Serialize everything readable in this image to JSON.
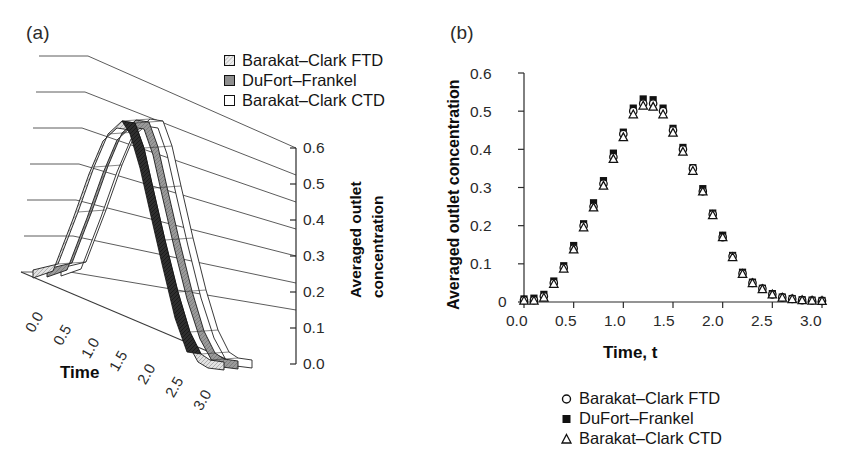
{
  "figure": {
    "background": "#ffffff",
    "width": 849,
    "height": 465
  },
  "panel_a": {
    "label": "(a)",
    "xaxis_title": "Time",
    "zaxis_title_line1": "Averaged outlet",
    "zaxis_title_line2": "concentration",
    "x_ticks": [
      "0.0",
      "0.5",
      "1.0",
      "1.5",
      "2.0",
      "2.5",
      "3.0"
    ],
    "z_ticks": [
      "0.6",
      "0.5",
      "0.4",
      "0.3",
      "0.2",
      "0.1",
      "0.0"
    ],
    "legend": [
      {
        "label": "Barakat–Clark FTD",
        "swatch": "light-hatched-square",
        "color": "#d8d8d8"
      },
      {
        "label": "DuFort–Frankel",
        "swatch": "gray-square",
        "color": "#8e8e8e"
      },
      {
        "label": "Barakat–Clark CTD",
        "swatch": "white-square",
        "color": "#ffffff"
      }
    ]
  },
  "panel_b": {
    "label": "(b)",
    "xaxis_title": "Time, t",
    "yaxis_title": "Averaged outlet concentration",
    "x_ticks": [
      "0.0",
      "0.5",
      "1.0",
      "1.5",
      "2.0",
      "2.5",
      "3.0"
    ],
    "y_ticks": [
      "0.6",
      "0.5",
      "0.4",
      "0.3",
      "0.2",
      "0.1",
      "0"
    ],
    "legend": [
      {
        "label": "Barakat–Clark FTD",
        "marker": "open-circle"
      },
      {
        "label": "DuFort–Frankel",
        "marker": "filled-square"
      },
      {
        "label": "Barakat–Clark CTD",
        "marker": "open-triangle"
      }
    ]
  },
  "chart_data": [
    {
      "type": "line",
      "id": "panel-a-surface-3d",
      "title": "(a)",
      "xlabel": "Time",
      "zlabel": "Averaged outlet concentration",
      "xlim": [
        0.0,
        3.0
      ],
      "zlim": [
        0.0,
        0.6
      ],
      "grid": true,
      "legend_position": "top-right",
      "note": "3D ribbon surface: three parallel method curves drawn as shaded bands over a sloping grid floor",
      "series": [
        {
          "name": "Barakat–Clark FTD",
          "fill": "#d8d8d8",
          "x": [
            0.0,
            0.1,
            0.2,
            0.3,
            0.4,
            0.5,
            0.6,
            0.7,
            0.8,
            0.9,
            1.0,
            1.1,
            1.2,
            1.3,
            1.4,
            1.5,
            1.6,
            1.7,
            1.8,
            1.9,
            2.0,
            2.1,
            2.2,
            2.3,
            2.4,
            2.5,
            2.6,
            2.7,
            2.8,
            2.9,
            3.0
          ],
          "values": [
            0.0,
            0.0,
            0.01,
            0.05,
            0.09,
            0.14,
            0.2,
            0.25,
            0.31,
            0.38,
            0.44,
            0.5,
            0.52,
            0.52,
            0.5,
            0.45,
            0.4,
            0.35,
            0.29,
            0.23,
            0.17,
            0.12,
            0.08,
            0.05,
            0.03,
            0.02,
            0.01,
            0.01,
            0.0,
            0.0,
            0.0
          ]
        },
        {
          "name": "DuFort–Frankel",
          "fill": "#8e8e8e",
          "x": [
            0.0,
            0.1,
            0.2,
            0.3,
            0.4,
            0.5,
            0.6,
            0.7,
            0.8,
            0.9,
            1.0,
            1.1,
            1.2,
            1.3,
            1.4,
            1.5,
            1.6,
            1.7,
            1.8,
            1.9,
            2.0,
            2.1,
            2.2,
            2.3,
            2.4,
            2.5,
            2.6,
            2.7,
            2.8,
            2.9,
            3.0
          ],
          "values": [
            0.0,
            0.01,
            0.02,
            0.06,
            0.1,
            0.15,
            0.21,
            0.26,
            0.32,
            0.39,
            0.45,
            0.51,
            0.53,
            0.53,
            0.51,
            0.46,
            0.41,
            0.36,
            0.3,
            0.24,
            0.18,
            0.13,
            0.08,
            0.05,
            0.03,
            0.02,
            0.01,
            0.01,
            0.0,
            0.0,
            0.0
          ]
        },
        {
          "name": "Barakat–Clark CTD",
          "fill": "#ffffff",
          "x": [
            0.0,
            0.1,
            0.2,
            0.3,
            0.4,
            0.5,
            0.6,
            0.7,
            0.8,
            0.9,
            1.0,
            1.1,
            1.2,
            1.3,
            1.4,
            1.5,
            1.6,
            1.7,
            1.8,
            1.9,
            2.0,
            2.1,
            2.2,
            2.3,
            2.4,
            2.5,
            2.6,
            2.7,
            2.8,
            2.9,
            3.0
          ],
          "values": [
            0.0,
            0.0,
            0.01,
            0.05,
            0.09,
            0.14,
            0.19,
            0.25,
            0.3,
            0.37,
            0.43,
            0.49,
            0.51,
            0.51,
            0.49,
            0.45,
            0.39,
            0.34,
            0.28,
            0.23,
            0.17,
            0.12,
            0.08,
            0.05,
            0.03,
            0.02,
            0.01,
            0.01,
            0.0,
            0.0,
            0.0
          ]
        }
      ]
    },
    {
      "type": "scatter",
      "id": "panel-b-scatter",
      "title": "(b)",
      "xlabel": "Time, t",
      "ylabel": "Averaged outlet concentration",
      "xlim": [
        0.0,
        3.0
      ],
      "ylim": [
        0.0,
        0.6
      ],
      "xticks": [
        0.0,
        0.5,
        1.0,
        1.5,
        2.0,
        2.5,
        3.0
      ],
      "yticks": [
        0.0,
        0.1,
        0.2,
        0.3,
        0.4,
        0.5,
        0.6
      ],
      "grid": false,
      "legend_position": "below-axes",
      "x": [
        0.0,
        0.1,
        0.2,
        0.3,
        0.4,
        0.5,
        0.6,
        0.7,
        0.8,
        0.9,
        1.0,
        1.1,
        1.2,
        1.3,
        1.4,
        1.5,
        1.6,
        1.7,
        1.8,
        1.9,
        2.0,
        2.1,
        2.2,
        2.3,
        2.4,
        2.5,
        2.6,
        2.7,
        2.8,
        2.9,
        3.0
      ],
      "series": [
        {
          "name": "Barakat–Clark FTD",
          "marker": "open-circle",
          "values": [
            0.005,
            0.005,
            0.015,
            0.05,
            0.09,
            0.14,
            0.2,
            0.25,
            0.31,
            0.38,
            0.44,
            0.5,
            0.52,
            0.52,
            0.5,
            0.45,
            0.4,
            0.35,
            0.29,
            0.23,
            0.17,
            0.12,
            0.075,
            0.05,
            0.035,
            0.02,
            0.012,
            0.008,
            0.005,
            0.004,
            0.003
          ]
        },
        {
          "name": "DuFort–Frankel",
          "marker": "filled-square",
          "values": [
            0.008,
            0.01,
            0.02,
            0.055,
            0.095,
            0.148,
            0.205,
            0.26,
            0.318,
            0.39,
            0.445,
            0.508,
            0.532,
            0.53,
            0.508,
            0.455,
            0.405,
            0.352,
            0.297,
            0.233,
            0.175,
            0.122,
            0.078,
            0.052,
            0.036,
            0.022,
            0.013,
            0.009,
            0.006,
            0.005,
            0.004
          ]
        },
        {
          "name": "Barakat–Clark CTD",
          "marker": "open-triangle",
          "values": [
            0.004,
            0.004,
            0.012,
            0.048,
            0.088,
            0.138,
            0.196,
            0.248,
            0.305,
            0.375,
            0.432,
            0.492,
            0.515,
            0.512,
            0.492,
            0.444,
            0.394,
            0.344,
            0.29,
            0.228,
            0.17,
            0.118,
            0.074,
            0.05,
            0.034,
            0.02,
            0.012,
            0.008,
            0.005,
            0.004,
            0.003
          ]
        }
      ]
    }
  ]
}
